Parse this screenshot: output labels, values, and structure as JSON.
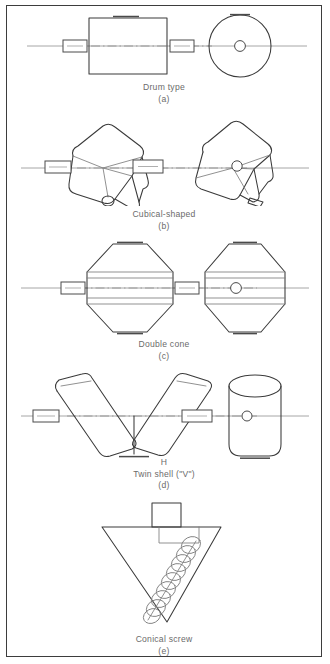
{
  "figure": {
    "type": "technical-line-diagram",
    "border_color": "#3d3d3d",
    "line_color": "#3a3a3a",
    "text_color": "#6b6b6b",
    "panels": [
      {
        "id": "a",
        "label": "(a)",
        "title": "Drum type",
        "views": [
          "side elevation",
          "end elevation"
        ],
        "features": [
          "rotating drum shell",
          "horizontal trunnion axis",
          "charge port on top",
          "shaft bearings"
        ]
      },
      {
        "id": "b",
        "label": "(b)",
        "title": "Cubical-shaped",
        "views": [
          "diagonal axis view",
          "rotated view"
        ],
        "features": [
          "cube body on diagonal axis",
          "rounded edges",
          "bottom discharge port",
          "shaft hub"
        ]
      },
      {
        "id": "c",
        "label": "(c)",
        "title": "Double cone",
        "views": [
          "side elevation",
          "end elevation"
        ],
        "features": [
          "twin conical ends",
          "central cylindrical band",
          "top charge port",
          "bottom discharge port"
        ]
      },
      {
        "id": "d",
        "label": "(d)",
        "title": "Twin shell (\"V\")",
        "annotation": "H",
        "views": [
          "front elevation",
          "side elevation"
        ],
        "features": [
          "two cylindrical arms in V",
          "rounded ends",
          "bottom discharge valve",
          "rotation axis through apex"
        ]
      },
      {
        "id": "e",
        "label": "(e)",
        "title": "Conical screw",
        "views": [
          "front elevation"
        ],
        "features": [
          "inverted conical vessel",
          "orbiting helical screw",
          "drive housing on top"
        ]
      }
    ]
  }
}
